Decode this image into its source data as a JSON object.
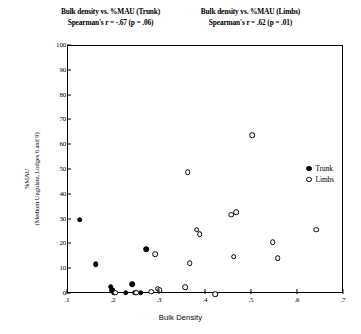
{
  "figure": {
    "titles": {
      "left_line1": "Bulk density vs. %MAU (Trunk)",
      "left_line2": "Spearman's r = -.67 (p = .06)",
      "right_line1": "Bulk density vs. %MAU (Limbs)",
      "right_line2": "Spearman's r = .62 (p = .01)"
    },
    "legend": {
      "trunk_label": "Trunk",
      "limbs_label": "Limbs"
    }
  },
  "chart_data": {
    "type": "scatter",
    "title": "Bulk density vs. %MAU (Trunk)   Bulk density vs. %MAU (Limbs)",
    "xlabel": "Bulk Density",
    "ylabel": "%MAU (Medium Ungulate, Lodges 6 and 9)",
    "ylabel_line1": "%MAU",
    "ylabel_line2": "(Medium Ungulate, Lodges 6 and 9)",
    "xlim": [
      0.1,
      0.7
    ],
    "ylim": [
      0,
      100
    ],
    "xticks": [
      ".1",
      ".2",
      ".3",
      ".4",
      ".5",
      ".6",
      ".7"
    ],
    "xtick_values": [
      0.1,
      0.2,
      0.3,
      0.4,
      0.5,
      0.6,
      0.7
    ],
    "yticks": [
      "0",
      "10",
      "20",
      "30",
      "40",
      "50",
      "60",
      "70",
      "80",
      "90",
      "100"
    ],
    "ytick_values": [
      0,
      10,
      20,
      30,
      40,
      50,
      60,
      70,
      80,
      90,
      100
    ],
    "grid": false,
    "legend_position": "right",
    "annotations": [
      "Spearman's r = -.67 (p = .06)",
      "Spearman's r = .62 (p = .01)"
    ],
    "series": [
      {
        "name": "Trunk",
        "marker": "filled-circle",
        "color": "#000000",
        "spearman_r": -0.67,
        "p_value": 0.06,
        "points": [
          {
            "x": 0.125,
            "y": 30.0
          },
          {
            "x": 0.16,
            "y": 12.0
          },
          {
            "x": 0.193,
            "y": 3.0
          },
          {
            "x": 0.196,
            "y": 1.5
          },
          {
            "x": 0.2,
            "y": 0.5
          },
          {
            "x": 0.225,
            "y": 0.5
          },
          {
            "x": 0.24,
            "y": 4.0
          },
          {
            "x": 0.246,
            "y": 0.5
          },
          {
            "x": 0.258,
            "y": 0.5
          },
          {
            "x": 0.27,
            "y": 18.0
          }
        ]
      },
      {
        "name": "Limbs",
        "marker": "open-circle",
        "color": "#000000",
        "spearman_r": 0.62,
        "p_value": 0.01,
        "points": [
          {
            "x": 0.203,
            "y": 0.5
          },
          {
            "x": 0.248,
            "y": 0.5
          },
          {
            "x": 0.281,
            "y": 1.0
          },
          {
            "x": 0.29,
            "y": 16.0
          },
          {
            "x": 0.295,
            "y": 2.2
          },
          {
            "x": 0.299,
            "y": 1.6
          },
          {
            "x": 0.355,
            "y": 2.8
          },
          {
            "x": 0.36,
            "y": 49.0
          },
          {
            "x": 0.365,
            "y": 12.5
          },
          {
            "x": 0.38,
            "y": 26.0
          },
          {
            "x": 0.386,
            "y": 24.0
          },
          {
            "x": 0.42,
            "y": 0.0
          },
          {
            "x": 0.455,
            "y": 32.0
          },
          {
            "x": 0.466,
            "y": 33.0
          },
          {
            "x": 0.46,
            "y": 15.0
          },
          {
            "x": 0.5,
            "y": 64.0
          },
          {
            "x": 0.545,
            "y": 21.0
          },
          {
            "x": 0.556,
            "y": 14.5
          },
          {
            "x": 0.64,
            "y": 26.0
          }
        ]
      }
    ]
  }
}
